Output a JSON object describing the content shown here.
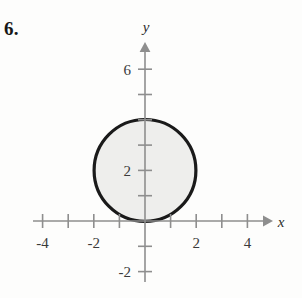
{
  "problem": {
    "number": "6."
  },
  "chart_data": {
    "type": "scatter",
    "title": "",
    "subtitle": "",
    "xlabel": "x",
    "ylabel": "y",
    "xlim": [
      -4.8,
      5.0
    ],
    "ylim": [
      -2.6,
      7.1
    ],
    "grid": false,
    "legend": null,
    "x_tick_labels": [
      "-4",
      "-2",
      "2",
      "4"
    ],
    "x_tick_values": [
      -4,
      -2,
      2,
      4
    ],
    "x_minor_ticks": [
      -3,
      -1,
      1,
      3
    ],
    "y_tick_labels": [
      "6",
      "2",
      "-2"
    ],
    "y_tick_values": [
      6,
      2,
      -2
    ],
    "y_minor_ticks": [
      5,
      4,
      3,
      1,
      -1
    ],
    "shapes": [
      {
        "kind": "circle",
        "equation": "x^2 + (y - 2)^2 = 4",
        "center_x": 0,
        "center_y": 2,
        "radius": 2,
        "stroke_color": "#1a1a1a",
        "fill_color": "#eeeeec",
        "stroke_width": 3
      }
    ],
    "axis_color": "#8e8e8e",
    "annotations": []
  }
}
